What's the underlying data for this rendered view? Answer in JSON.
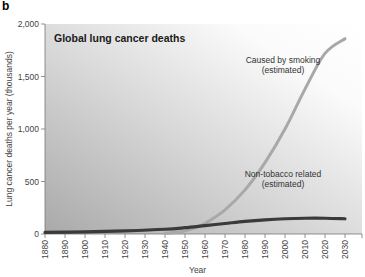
{
  "panel_label": "b",
  "chart_data": {
    "type": "line",
    "title": "Global lung cancer deaths",
    "xlabel": "Year",
    "ylabel": "Lung cancer deaths per year (thousands)",
    "xlim": [
      1880,
      2030
    ],
    "ylim": [
      0,
      2000
    ],
    "x_ticks": [
      "1880",
      "1890",
      "1900",
      "1910",
      "1920",
      "1930",
      "1940",
      "1950",
      "1960",
      "1970",
      "1980",
      "1990",
      "2000",
      "2010",
      "2020",
      "2030"
    ],
    "y_ticks": [
      "0",
      "500",
      "1,000",
      "1,500",
      "2,000"
    ],
    "y_tick_values": [
      0,
      500,
      1000,
      1500,
      2000
    ],
    "grid": false,
    "legend": "none (inline annotations)",
    "series": [
      {
        "name": "Caused by smoking (estimated)",
        "color": "#a8a8a8",
        "x": [
          1940,
          1945,
          1950,
          1955,
          1960,
          1970,
          1980,
          1990,
          2000,
          2010,
          2020,
          2030
        ],
        "values": [
          5,
          15,
          30,
          60,
          100,
          230,
          420,
          680,
          1000,
          1380,
          1720,
          1860
        ]
      },
      {
        "name": "Non-tobacco related (estimated)",
        "color": "#3a3a3a",
        "x": [
          1880,
          1900,
          1920,
          1940,
          1950,
          1960,
          1970,
          1980,
          1990,
          2000,
          2010,
          2020,
          2030
        ],
        "values": [
          15,
          20,
          30,
          45,
          60,
          80,
          100,
          120,
          135,
          145,
          150,
          150,
          145
        ]
      }
    ],
    "annotations": [
      {
        "text": [
          "Caused by smoking",
          "(estimated)"
        ],
        "near_series": "Caused by smoking (estimated)"
      },
      {
        "text": [
          "Non-tobacco related",
          "(estimated)"
        ],
        "near_series": "Non-tobacco related (estimated)"
      }
    ]
  }
}
